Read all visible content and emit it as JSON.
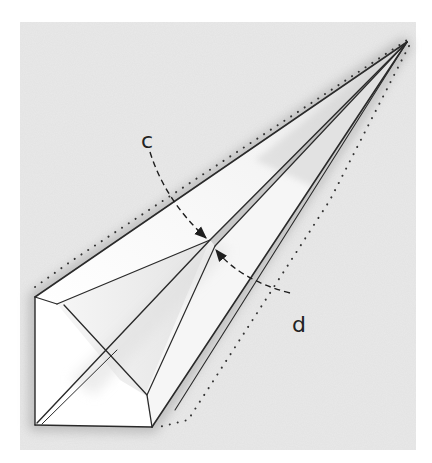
{
  "diagram": {
    "type": "origami-fold-step",
    "colors": {
      "page": "#ffffff",
      "table": "#e9e9e9",
      "paper": "#ffffff",
      "paper_shade": "#dcdcdc",
      "line": "#2a2a2a",
      "dots": "#333333",
      "arrow": "#1e1e1e"
    },
    "labels": {
      "c": "c",
      "d": "d"
    },
    "arrows": [
      {
        "name": "arrow-c",
        "label": "c",
        "from": [
          150,
          152
        ],
        "to": [
          206,
          238
        ]
      },
      {
        "name": "arrow-d",
        "label": "d",
        "from": [
          290,
          293
        ],
        "to": [
          216,
          250
        ]
      }
    ],
    "points": {
      "tip": [
        407,
        42
      ],
      "top_left_corner": [
        35,
        297
      ],
      "bottom_left_corner": [
        35,
        425
      ],
      "bottom_right_corner": [
        152,
        427
      ],
      "fold_meet": [
        210,
        240
      ]
    }
  }
}
